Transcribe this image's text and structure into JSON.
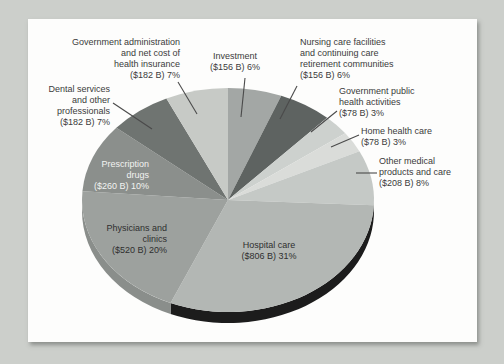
{
  "page": {
    "background_color": "#cccfcb",
    "card_color": "#fdfdfc"
  },
  "chart_data": {
    "type": "pie",
    "style": "3d",
    "title": "",
    "start_angle_deg": 0,
    "clockwise": true,
    "total_billions": 2626,
    "default_side_color": "#1d1d1d",
    "leader_line_color": "#4a4a4a",
    "slices": [
      {
        "id": "investment",
        "label": "Investment",
        "value_billions": 156,
        "percent": 6,
        "display": "($156 B) 6%",
        "color": "#a3a7a5"
      },
      {
        "id": "nursing-care",
        "label": "Nursing care facilities and continuing care retirement communities",
        "value_billions": 156,
        "percent": 6,
        "display": "($156 B) 6%",
        "color": "#5e6361"
      },
      {
        "id": "gov-public-health",
        "label": "Government public health activities",
        "value_billions": 78,
        "percent": 3,
        "display": "($78 B) 3%",
        "color": "#cdd1ce"
      },
      {
        "id": "home-health",
        "label": "Home health care",
        "value_billions": 78,
        "percent": 3,
        "display": "($78 B) 3%",
        "color": "#dadcd9"
      },
      {
        "id": "other-medical",
        "label": "Other medical products and care",
        "value_billions": 208,
        "percent": 8,
        "display": "($208 B) 8%",
        "color": "#c5c9c6"
      },
      {
        "id": "hospital-care",
        "label": "Hospital care",
        "value_billions": 806,
        "percent": 31,
        "display": "($806 B) 31%",
        "color": "#b3b7b4",
        "side_color": "#1c1c1c"
      },
      {
        "id": "physicians",
        "label": "Physicians and clinics",
        "value_billions": 520,
        "percent": 20,
        "display": "($520 B) 20%",
        "color": "#9da19e",
        "side_color": "#8a8e8b"
      },
      {
        "id": "prescription-drugs",
        "label": "Prescription drugs",
        "value_billions": 260,
        "percent": 10,
        "display": "($260 B) 10%",
        "color": "#8b8f8c"
      },
      {
        "id": "dental",
        "label": "Dental services and other professionals",
        "value_billions": 182,
        "percent": 7,
        "display": "($182 B) 7%",
        "color": "#6f7471"
      },
      {
        "id": "gov-admin",
        "label": "Government administration and net cost of health insurance",
        "value_billions": 182,
        "percent": 7,
        "display": "($182 B) 7%",
        "color": "#c7cac6"
      }
    ],
    "callouts": [
      {
        "slice": "gov-admin",
        "lines": [
          "Government administration",
          "and net cost of",
          "health insurance",
          "($182 B) 7%"
        ],
        "x": 180,
        "y": 37,
        "align": "right",
        "leader": [
          178,
          82,
          197,
          114
        ]
      },
      {
        "slice": "investment",
        "lines": [
          "Investment",
          "($156 B) 6%"
        ],
        "x": 235,
        "y": 51,
        "align": "center",
        "leader": [
          245,
          78,
          241,
          117
        ]
      },
      {
        "slice": "nursing-care",
        "lines": [
          "Nursing care facilities",
          "and continuing care",
          "retirement communities",
          "($156 B) 6%"
        ],
        "x": 300,
        "y": 37,
        "align": "left",
        "leader": [
          297,
          86,
          280,
          119
        ]
      },
      {
        "slice": "gov-public-health",
        "lines": [
          "Government public",
          "health activities",
          "($78 B) 3%"
        ],
        "x": 339,
        "y": 86,
        "align": "left",
        "leader": [
          337,
          111,
          311,
          132
        ]
      },
      {
        "slice": "home-health",
        "lines": [
          "Home health care",
          "($78 B) 3%"
        ],
        "x": 361,
        "y": 126,
        "align": "left",
        "leader": [
          359,
          135,
          331,
          147
        ]
      },
      {
        "slice": "other-medical",
        "lines": [
          "Other medical",
          "products and care",
          "($208 B) 8%"
        ],
        "x": 379,
        "y": 156,
        "align": "left",
        "leader": [
          377,
          173,
          356,
          173
        ]
      },
      {
        "slice": "dental",
        "lines": [
          "Dental services",
          "and other",
          "professionals",
          "($182 B) 7%"
        ],
        "x": 110,
        "y": 84,
        "align": "right",
        "leader": [
          113,
          103,
          152,
          129
        ]
      },
      {
        "slice": "prescription-drugs",
        "lines": [
          "Prescription",
          "drugs",
          "($260 B) 10%"
        ],
        "x": 149,
        "y": 159,
        "align": "right",
        "text_color": "#f2f3f1"
      },
      {
        "slice": "physicians",
        "lines": [
          "Physicians and",
          "clinics",
          "($520 B) 20%"
        ],
        "x": 167,
        "y": 223,
        "align": "right",
        "text_color": "#2f2f2f"
      },
      {
        "slice": "hospital-care",
        "lines": [
          "Hospital care",
          "($806 B) 31%"
        ],
        "x": 269,
        "y": 240,
        "align": "center",
        "text_color": "#2f2f2f"
      }
    ]
  }
}
